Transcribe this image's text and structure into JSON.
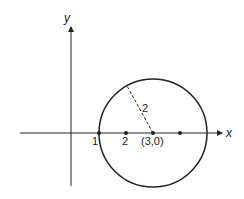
{
  "diagram": {
    "axes": {
      "x_label": "x",
      "y_label": "y"
    },
    "circle": {
      "center_label": "(3,0)",
      "radius_label": "2"
    },
    "tick_labels": [
      "1",
      "2"
    ]
  }
}
